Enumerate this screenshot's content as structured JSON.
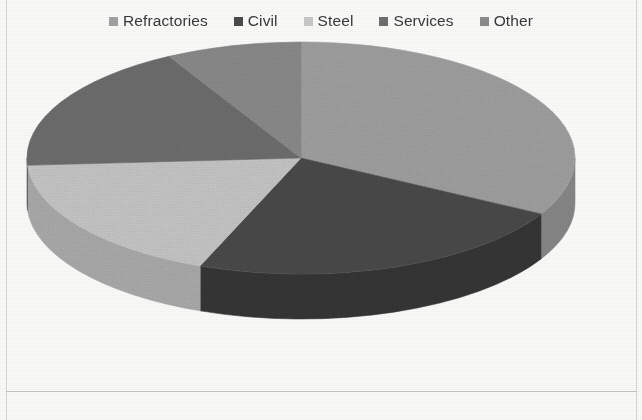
{
  "chart_data": {
    "type": "pie",
    "title": "",
    "subtitle": "",
    "xlabel": "",
    "ylabel": "",
    "three_d": true,
    "grid": false,
    "legend_position": "top",
    "start_angle_deg": 0,
    "direction": "clockwise",
    "categories": [
      "Refractories",
      "Civil",
      "Steel",
      "Services",
      "Other"
    ],
    "values": [
      33,
      23,
      18,
      18,
      8
    ],
    "colors": [
      "#a2a2a2",
      "#4b4b4b",
      "#c9c9c9",
      "#6f6f6f",
      "#8c8c8c"
    ],
    "side_colors": [
      "#8a8a8a",
      "#363636",
      "#adadad",
      "#5b5b5b",
      "#747474"
    ],
    "slices": [
      {
        "label": "Refractories",
        "value": 33,
        "color": "#a2a2a2",
        "side_color": "#8a8a8a",
        "start_deg": 0,
        "end_deg": 118.8
      },
      {
        "label": "Civil",
        "value": 23,
        "color": "#4b4b4b",
        "side_color": "#363636",
        "start_deg": 118.8,
        "end_deg": 201.6
      },
      {
        "label": "Steel",
        "value": 18,
        "color": "#c9c9c9",
        "side_color": "#adadad",
        "start_deg": 201.6,
        "end_deg": 266.4
      },
      {
        "label": "Services",
        "value": 18,
        "color": "#6f6f6f",
        "side_color": "#5b5b5b",
        "start_deg": 266.4,
        "end_deg": 331.2
      },
      {
        "label": "Other",
        "value": 8,
        "color": "#8c8c8c",
        "side_color": "#747474",
        "start_deg": 331.2,
        "end_deg": 360
      }
    ],
    "geometry": {
      "cx": 301,
      "cy": 124,
      "rx": 274,
      "ry": 116,
      "depth": 45
    }
  },
  "legend": {
    "items": [
      {
        "label": "Refractories",
        "swatch": "#a2a2a2",
        "icon": "legend-swatch-icon"
      },
      {
        "label": "Civil",
        "swatch": "#4b4b4b",
        "icon": "legend-swatch-icon"
      },
      {
        "label": "Steel",
        "swatch": "#c9c9c9",
        "icon": "legend-swatch-icon"
      },
      {
        "label": "Services",
        "swatch": "#6f6f6f",
        "icon": "legend-swatch-icon"
      },
      {
        "label": "Other",
        "swatch": "#8c8c8c",
        "icon": "legend-swatch-icon"
      }
    ]
  }
}
